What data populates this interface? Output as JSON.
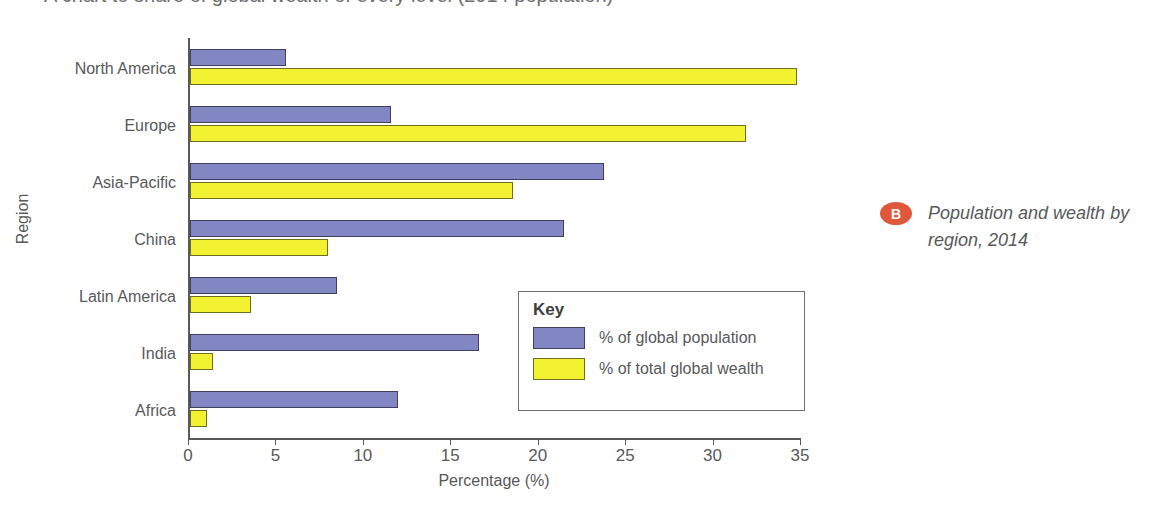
{
  "title_clipped": "A chart to share of global wealth of every level (2014 population)",
  "caption": {
    "badge": "B",
    "text": "Population and wealth by region, 2014"
  },
  "legend": {
    "title": "Key",
    "items": [
      {
        "label": "% of global population",
        "color": "#8287c4",
        "swatch_name": "population-swatch"
      },
      {
        "label": "% of total global wealth",
        "color": "#f2f232",
        "swatch_name": "wealth-swatch"
      }
    ]
  },
  "axes": {
    "xlabel": "Percentage (%)",
    "ylabel": "Region",
    "xticks": [
      "0",
      "5",
      "10",
      "15",
      "20",
      "25",
      "30",
      "35"
    ]
  },
  "chart_data": {
    "type": "bar",
    "orientation": "horizontal",
    "title": "Population and wealth by region, 2014",
    "xlabel": "Percentage (%)",
    "ylabel": "Region",
    "xlim": [
      0,
      35
    ],
    "xtick_step": 5,
    "grid": false,
    "legend_position": "inside-lower-right",
    "categories": [
      "North America",
      "Europe",
      "Asia-Pacific",
      "China",
      "Latin America",
      "India",
      "Africa"
    ],
    "series": [
      {
        "name": "% of global population",
        "color": "#8287c4",
        "values": [
          5.5,
          11.5,
          23.7,
          21.4,
          8.4,
          16.5,
          11.9
        ]
      },
      {
        "name": "% of total global wealth",
        "color": "#f2f232",
        "values": [
          34.7,
          31.8,
          18.5,
          7.9,
          3.5,
          1.3,
          1.0
        ]
      }
    ]
  }
}
